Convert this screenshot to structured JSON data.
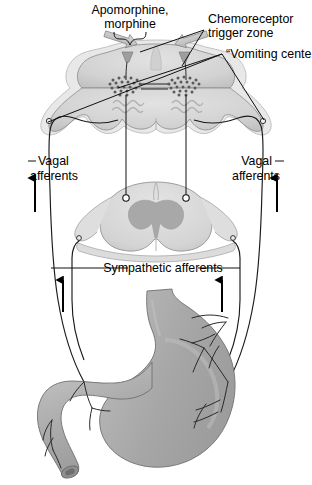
{
  "figure": {
    "width": 312,
    "height": 485,
    "background_color": "#ffffff"
  },
  "labels": {
    "drug_line1": "Apomorphine,",
    "drug_line2": "morphine",
    "ctz_line1": "Chemoreceptor",
    "ctz_line2": "trigger zone",
    "vomiting_center": "“Vomiting center”",
    "vagal_left_line1": "Vagal",
    "vagal_left_line2": "afferents",
    "vagal_right_line1": "Vagal",
    "vagal_right_line2": "afferents",
    "sympathetic": "Sympathetic afferents"
  },
  "structures": [
    {
      "name": "medulla-cross-section",
      "label": "Medulla oblongata cross-section"
    },
    {
      "name": "spinal-cord-cross-section",
      "label": "Spinal cord cross-section"
    },
    {
      "name": "stomach",
      "label": "Stomach"
    },
    {
      "name": "duodenum",
      "label": "Duodenum"
    },
    {
      "name": "chemoreceptor-trigger-zone-nucleus",
      "label": "Chemoreceptor trigger zone"
    },
    {
      "name": "vomiting-center-nucleus",
      "label": "Vomiting center"
    }
  ],
  "arrows": {
    "drug_block_arrows": 2,
    "vagal_afferent_arrows": 2,
    "sympathetic_afferent_arrows": 2,
    "direction": "up"
  },
  "colors": {
    "tissue_light": "#dcdcdc",
    "tissue_mid": "#c9c9c9",
    "tissue_dark": "#a9a9a9",
    "gray_matter": "#a8a8a8",
    "organ_fill": "#ababab",
    "organ_highlight": "#c4c4c4",
    "outline": "#6f6f6f",
    "line": "#111111",
    "text": "#000000",
    "background": "#ffffff"
  }
}
